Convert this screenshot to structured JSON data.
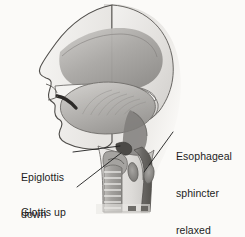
{
  "figure": {
    "background_color": "#fbfaf8",
    "ink_color": "#1d1d1d",
    "width": 245,
    "height": 237
  },
  "labels": {
    "epiglottis": {
      "line1": "Epiglottis",
      "line2": "down",
      "full": "Epiglottis down"
    },
    "glottis": {
      "line1": "Glottis up",
      "line2": "and closed",
      "full": "Glottis up and closed"
    },
    "esophageal": {
      "line1": "Esophageal",
      "line2": "sphincter",
      "line3": "relaxed",
      "full": "Esophageal sphincter relaxed"
    }
  },
  "anatomy": {
    "structures": [
      "nasal cavity",
      "hard palate",
      "soft palate",
      "tongue",
      "lips",
      "teeth",
      "oropharynx",
      "epiglottis",
      "glottis",
      "larynx",
      "trachea",
      "esophagus",
      "upper esophageal sphincter"
    ],
    "palette": {
      "outline": "#4a4a4a",
      "tissue_light": "#efeeec",
      "tissue_mid": "#c9c7c4",
      "tissue_dark": "#8d8b88",
      "cavity_dark": "#6e6c69",
      "shadow": "#b9b7b4"
    }
  },
  "leader_lines": [
    {
      "name": "epiglottis-leader",
      "from": "Epiglottis label",
      "to": "epiglottis"
    },
    {
      "name": "glottis-leader",
      "from": "Glottis up and closed label",
      "to": "glottis"
    },
    {
      "name": "esophageal-leader",
      "from": "Esophageal sphincter relaxed label",
      "to": "upper esophageal sphincter"
    }
  ]
}
